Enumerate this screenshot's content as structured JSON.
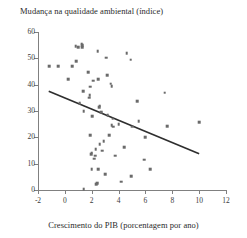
{
  "chart_data": {
    "type": "scatter",
    "title": "",
    "ylabel": "Mudança na qualidade ambiental (índice)",
    "xlabel": "Crescimento do PIB (porcentagem por ano)",
    "xlim": [
      -2,
      12
    ],
    "ylim": [
      0,
      60
    ],
    "xticks": [
      -2,
      0,
      2,
      4,
      6,
      8,
      10,
      12
    ],
    "yticks": [
      0,
      10,
      20,
      30,
      40,
      50,
      60
    ],
    "grid": false,
    "legend": null,
    "marker_color": "#6a6a6a",
    "trendline_color": "#2e2e2e",
    "axis_color": "#808080",
    "trendline": {
      "x": [
        -1.2,
        10.0
      ],
      "y": [
        37.5,
        13.8
      ],
      "slope": -2.12,
      "intercept": 34.96
    },
    "points": [
      [
        -1.15,
        47.0
      ],
      [
        -0.5,
        47.0
      ],
      [
        0.25,
        42.0
      ],
      [
        0.55,
        47.0
      ],
      [
        0.8,
        54.5
      ],
      [
        0.85,
        49.0
      ],
      [
        1.0,
        54.3
      ],
      [
        1.25,
        55.5
      ],
      [
        1.3,
        54.2
      ],
      [
        1.3,
        55.0
      ],
      [
        1.1,
        33.0
      ],
      [
        1.35,
        37.5
      ],
      [
        1.4,
        30.0
      ],
      [
        1.4,
        0.4
      ],
      [
        1.75,
        44.8
      ],
      [
        1.8,
        35.0
      ],
      [
        1.85,
        36.0
      ],
      [
        1.9,
        39.3
      ],
      [
        1.9,
        20.8
      ],
      [
        1.95,
        13.7
      ],
      [
        2.0,
        14.2
      ],
      [
        2.0,
        7.8
      ],
      [
        2.05,
        28.0
      ],
      [
        2.1,
        41.5
      ],
      [
        2.2,
        11.9
      ],
      [
        2.25,
        13.0
      ],
      [
        2.3,
        15.5
      ],
      [
        2.35,
        2.2
      ],
      [
        2.4,
        2.5
      ],
      [
        2.45,
        52.8
      ],
      [
        2.5,
        8.0
      ],
      [
        2.5,
        42.0
      ],
      [
        2.55,
        31.5
      ],
      [
        2.6,
        32.0
      ],
      [
        2.6,
        17.5
      ],
      [
        2.7,
        29.5
      ],
      [
        2.8,
        15.0
      ],
      [
        2.9,
        18.5
      ],
      [
        3.0,
        6.0
      ],
      [
        3.1,
        50.3
      ],
      [
        3.15,
        43.5
      ],
      [
        3.2,
        28.5
      ],
      [
        3.3,
        20.8
      ],
      [
        3.4,
        40.3
      ],
      [
        3.5,
        24.5
      ],
      [
        3.5,
        39.5
      ],
      [
        3.55,
        27.0
      ],
      [
        3.6,
        24.0
      ],
      [
        3.75,
        13.0
      ],
      [
        4.0,
        25.0
      ],
      [
        4.2,
        3.2
      ],
      [
        4.4,
        16.3
      ],
      [
        4.6,
        52.0
      ],
      [
        4.9,
        49.5
      ],
      [
        4.95,
        5.2
      ],
      [
        5.0,
        24.0
      ],
      [
        5.4,
        33.8
      ],
      [
        5.5,
        26.2
      ],
      [
        5.9,
        11.5
      ],
      [
        6.0,
        20.0
      ],
      [
        6.35,
        8.0
      ],
      [
        7.45,
        37.0
      ],
      [
        7.6,
        24.2
      ],
      [
        10.0,
        25.7
      ]
    ]
  }
}
